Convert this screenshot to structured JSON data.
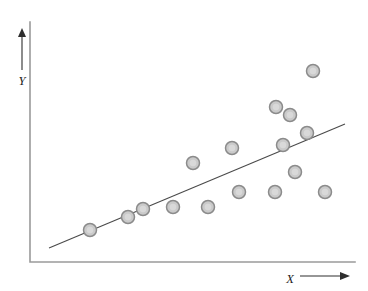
{
  "figure": {
    "title": "",
    "width": 368,
    "height": 291,
    "background_color": "#ffffff"
  },
  "axes": {
    "color": "#9a9a9a",
    "origin_x": 30,
    "origin_y": 262,
    "x_axis_end": 355,
    "y_axis_top": 22,
    "x_label": "X",
    "y_label": "Y",
    "x_label_x": 290,
    "x_label_y": 280,
    "y_label_x": 22,
    "y_label_y": 82,
    "x_arrow": {
      "x1": 300,
      "y1": 276,
      "x2": 348,
      "y2": 276,
      "color": "#2e2e2e"
    },
    "y_arrow": {
      "x1": 22,
      "y1": 70,
      "x2": 22,
      "y2": 30,
      "color": "#2e2e2e"
    }
  },
  "chart_data": {
    "type": "scatter",
    "title": "",
    "subtitle": "",
    "xlabel": "X",
    "ylabel": "Y",
    "grid": false,
    "legend": null,
    "legend_position": "none",
    "xlim": [
      0,
      100
    ],
    "ylim": [
      0,
      100
    ],
    "xticks": [],
    "yticks": [],
    "xticklabels": [],
    "yticklabels": [],
    "annotations": [],
    "marker": {
      "shape": "circle",
      "diameter_px": 13,
      "fill_color": "#cacaca",
      "edge_color": "#8b8b8b"
    },
    "series": [
      {
        "name": "observations",
        "type": "scatter",
        "points_px": [
          {
            "x": 90,
            "y": 230
          },
          {
            "x": 128,
            "y": 217
          },
          {
            "x": 143,
            "y": 209
          },
          {
            "x": 173,
            "y": 207
          },
          {
            "x": 193,
            "y": 163
          },
          {
            "x": 208,
            "y": 207
          },
          {
            "x": 232,
            "y": 148
          },
          {
            "x": 239,
            "y": 192
          },
          {
            "x": 275,
            "y": 192
          },
          {
            "x": 276,
            "y": 107
          },
          {
            "x": 283,
            "y": 145
          },
          {
            "x": 290,
            "y": 115
          },
          {
            "x": 295,
            "y": 172
          },
          {
            "x": 307,
            "y": 133
          },
          {
            "x": 313,
            "y": 71
          },
          {
            "x": 325,
            "y": 192
          }
        ],
        "x": [
          18.5,
          30.2,
          34.8,
          44.0,
          50.2,
          54.8,
          62.2,
          64.3,
          75.4,
          75.7,
          77.8,
          80.0,
          81.5,
          85.2,
          87.1,
          90.8
        ],
        "y": [
          13.3,
          18.8,
          22.1,
          22.9,
          41.3,
          22.9,
          47.5,
          29.2,
          29.2,
          64.6,
          48.8,
          61.3,
          37.5,
          53.8,
          79.6,
          29.2
        ]
      },
      {
        "name": "regression-line",
        "type": "line",
        "color": "#4a4a4a",
        "endpoints_px": [
          {
            "x": 49,
            "y": 248
          },
          {
            "x": 345,
            "y": 124
          }
        ],
        "x": [
          6.1,
          96.9
        ],
        "y": [
          5.8,
          57.5
        ]
      }
    ]
  }
}
